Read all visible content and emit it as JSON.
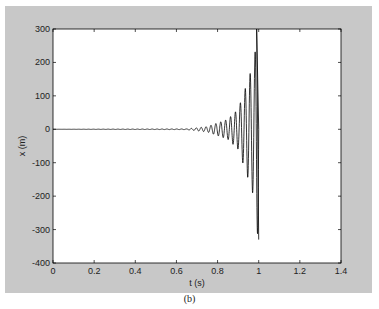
{
  "chart_data": {
    "type": "line",
    "title": "",
    "xlabel": "t (s)",
    "ylabel": "x (m)",
    "xlim": [
      0,
      1.4
    ],
    "ylim": [
      -400,
      300
    ],
    "xticks": [
      0,
      0.2,
      0.4,
      0.6,
      0.8,
      1,
      1.2,
      1.4
    ],
    "xtick_labels": [
      "0",
      "0.2",
      "0.4",
      "0.6",
      "0.8",
      "1",
      "1.2",
      "1.4"
    ],
    "yticks": [
      300,
      200,
      100,
      0,
      -100,
      -200,
      -300,
      -400
    ],
    "ytick_labels": [
      "300",
      "200",
      "100",
      "0",
      "-100",
      "-200",
      "-300",
      "-400"
    ],
    "grid": false,
    "legend": null,
    "series": [
      {
        "name": "x(t)",
        "color": "#000000",
        "description": "Flat at 0 until ~0.65 s, then exponentially growing oscillation; peaks reach ~+300 and troughs ~-330 near t = 1.0 s, signal ends at ~1.0 s",
        "envelope_points": [
          {
            "t": 0.0,
            "amp": 0
          },
          {
            "t": 0.65,
            "amp": 1
          },
          {
            "t": 0.75,
            "amp": 8
          },
          {
            "t": 0.85,
            "amp": 30
          },
          {
            "t": 0.9,
            "amp": 60
          },
          {
            "t": 0.95,
            "amp": 150
          },
          {
            "t": 0.98,
            "amp": 210
          },
          {
            "t": 0.99,
            "amp": 300
          },
          {
            "t": 1.0,
            "amp": 330
          }
        ]
      }
    ]
  },
  "caption": "(b)"
}
